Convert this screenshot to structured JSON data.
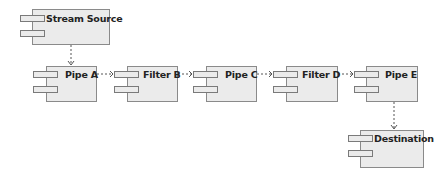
{
  "diagram": {
    "type": "uml-component",
    "colors": {
      "box_fill": "#ebebeb",
      "box_border": "#8a8a8a",
      "connector": "#555555",
      "text": "#222222"
    },
    "components": [
      {
        "id": "stream_source",
        "label": "Stream Source"
      },
      {
        "id": "pipe_a",
        "label": "Pipe A"
      },
      {
        "id": "filter_b",
        "label": "Filter B"
      },
      {
        "id": "pipe_c",
        "label": "Pipe C"
      },
      {
        "id": "filter_d",
        "label": "Filter D"
      },
      {
        "id": "pipe_e",
        "label": "Pipe E"
      },
      {
        "id": "destination",
        "label": "Destination"
      }
    ],
    "connections": [
      {
        "from": "Stream Source",
        "to": "Pipe A",
        "style": "dashed-open-arrow"
      },
      {
        "from": "Pipe A",
        "to": "Filter B",
        "style": "dashed-open-arrow"
      },
      {
        "from": "Filter B",
        "to": "Pipe C",
        "style": "dashed-open-arrow"
      },
      {
        "from": "Pipe C",
        "to": "Filter D",
        "style": "dashed-open-arrow"
      },
      {
        "from": "Filter D",
        "to": "Pipe E",
        "style": "dashed-open-arrow"
      },
      {
        "from": "Pipe E",
        "to": "Destination",
        "style": "dashed-open-arrow"
      }
    ]
  }
}
